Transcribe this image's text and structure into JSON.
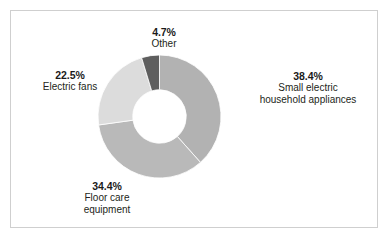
{
  "figure": {
    "background_color": "#ffffff",
    "border_color": "#cfcfcf"
  },
  "chart_data": {
    "type": "pie",
    "variant": "donut",
    "title": "",
    "subtitle": "",
    "xlabel": "",
    "ylabel": "",
    "legend_position": "none",
    "grid": false,
    "label_format": "percent-and-category",
    "start_angle_deg": 0,
    "direction": "clockwise",
    "inner_radius_ratio": 0.435,
    "categories": [
      "Small electric household appliances",
      "Floor care equipment",
      "Electric fans",
      "Other"
    ],
    "values": [
      38.4,
      34.4,
      22.5,
      4.7
    ],
    "units": "%",
    "colors": [
      "#b2b2b2",
      "#b9b9b9",
      "#dcdcdc",
      "#5e5e5e"
    ],
    "slices": [
      {
        "category": "Small electric household appliances",
        "value": 38.4,
        "percent_label": "38.4%",
        "color": "#b2b2b2",
        "label_lines": [
          "Small electric",
          "household appliances"
        ],
        "label_position": "right"
      },
      {
        "category": "Floor care equipment",
        "value": 34.4,
        "percent_label": "34.4%",
        "color": "#b9b9b9",
        "label_lines": [
          "Floor care",
          "equipment"
        ],
        "label_position": "bottom-left"
      },
      {
        "category": "Electric fans",
        "value": 22.5,
        "percent_label": "22.5%",
        "color": "#dcdcdc",
        "label_lines": [
          "Electric fans"
        ],
        "label_position": "left"
      },
      {
        "category": "Other",
        "value": 4.7,
        "percent_label": "4.7%",
        "color": "#5e5e5e",
        "label_lines": [
          "Other"
        ],
        "label_position": "top"
      }
    ]
  },
  "labels": {
    "other": {
      "percent": "4.7%",
      "line1": "Other",
      "line2": ""
    },
    "small_electric": {
      "percent": "38.4%",
      "line1": "Small electric",
      "line2": "household appliances"
    },
    "electric_fans": {
      "percent": "22.5%",
      "line1": "Electric fans",
      "line2": ""
    },
    "floor_care": {
      "percent": "34.4%",
      "line1": "Floor care",
      "line2": "equipment"
    }
  }
}
